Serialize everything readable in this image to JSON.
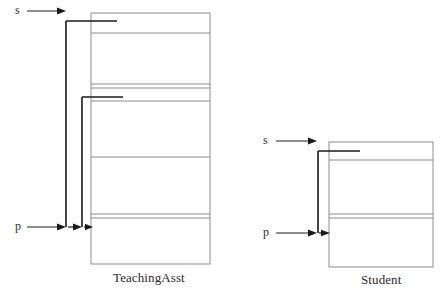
{
  "figure": {
    "title": "",
    "background_color": "#ffffff",
    "stroke_color_thin": "#888888",
    "stroke_color_bold": "#1a1a1a",
    "width": 446,
    "height": 298
  },
  "objects": [
    {
      "id": "teachingasst",
      "label": "TeachingAsst",
      "box": {
        "x": 91,
        "y": 13,
        "width": 119,
        "height": 251
      },
      "dividers_y": [
        33,
        84,
        88,
        101,
        157,
        214,
        224
      ]
    },
    {
      "id": "student",
      "label": "Student",
      "box": {
        "x": 329,
        "y": 142,
        "width": 104,
        "height": 125
      },
      "dividers_y": [
        160,
        214,
        218
      ]
    }
  ],
  "pointers": [
    {
      "id": "s1",
      "label": "s",
      "target_object": "teachingasst",
      "arrow_x1": 27,
      "arrow_x2": 64,
      "arrow_y": 11
    },
    {
      "id": "p1",
      "label": "p",
      "target_object": "teachingasst",
      "arrow_x1": 27,
      "arrow_x2": 64,
      "arrow_y": 227
    },
    {
      "id": "s2",
      "label": "s",
      "target_object": "student",
      "arrow_x1": 276,
      "arrow_x2": 314,
      "arrow_y": 141
    },
    {
      "id": "p2",
      "label": "p",
      "target_object": "student",
      "arrow_x1": 276,
      "arrow_x2": 314,
      "arrow_y": 233
    }
  ],
  "labels": {
    "teachingasst": "TeachingAsst",
    "student": "Student",
    "s_left": "s",
    "p_left": "p",
    "s_right": "s",
    "p_right": "p"
  }
}
